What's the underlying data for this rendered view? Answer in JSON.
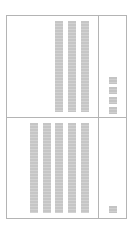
{
  "layout": {
    "frame_color": "#b4b4b4",
    "placeholder_color": "#cacaca",
    "background": "#ffffff"
  },
  "top_panel": {
    "main": {
      "bars": [
        {
          "x": 48,
          "y": 5,
          "h": 91
        },
        {
          "x": 61,
          "y": 5,
          "h": 91
        },
        {
          "x": 74,
          "y": 5,
          "h": 91
        }
      ]
    },
    "side": {
      "squares": [
        {
          "x": 102,
          "y": 61
        },
        {
          "x": 102,
          "y": 71
        },
        {
          "x": 102,
          "y": 81
        },
        {
          "x": 102,
          "y": 91
        }
      ]
    }
  },
  "bottom_panel": {
    "main": {
      "bars": [
        {
          "x": 23,
          "y": 107,
          "h": 90
        },
        {
          "x": 36,
          "y": 107,
          "h": 90
        },
        {
          "x": 48,
          "y": 107,
          "h": 90
        },
        {
          "x": 61,
          "y": 107,
          "h": 90
        },
        {
          "x": 74,
          "y": 107,
          "h": 90
        }
      ]
    },
    "side": {
      "squares": [
        {
          "x": 102,
          "y": 190
        }
      ]
    }
  }
}
